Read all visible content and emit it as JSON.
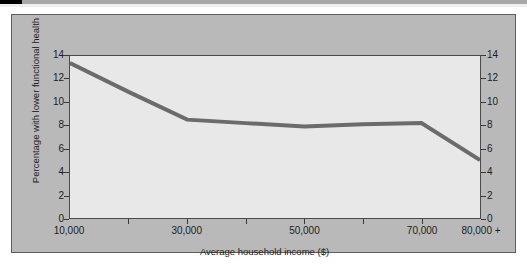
{
  "chart_data": {
    "type": "line",
    "title": "",
    "xlabel": "Average household income ($)",
    "ylabel": "Percentage with lower functional health",
    "x": [
      10000,
      20000,
      30000,
      40000,
      50000,
      60000,
      70000,
      80000
    ],
    "categories": [
      "10,000",
      "20,000",
      "30,000",
      "40,000",
      "50,000",
      "60,000",
      "70,000",
      "80,000 +"
    ],
    "values": [
      13.4,
      10.9,
      8.5,
      8.2,
      7.9,
      8.1,
      8.2,
      5.0
    ],
    "series": [
      {
        "name": "Percentage with lower functional health",
        "values": [
          13.4,
          10.9,
          8.5,
          8.2,
          7.9,
          8.1,
          8.2,
          5.0
        ],
        "color": "#6b6b6b"
      }
    ],
    "xlim": [
      10000,
      80000
    ],
    "ylim": [
      0,
      14
    ],
    "y_ticks": [
      0,
      2,
      4,
      6,
      8,
      10,
      12,
      14
    ],
    "y_tick_labels": [
      "0",
      "2",
      "4",
      "6",
      "8",
      "10",
      "12",
      "14"
    ],
    "y_axis_right_tick_labels": [
      "0",
      "2",
      "4",
      "6",
      "8",
      "10",
      "12",
      "14"
    ],
    "x_major_ticks": [
      10000,
      30000,
      50000,
      70000,
      80000
    ],
    "x_major_tick_labels": [
      "10,000",
      "30,000",
      "50,000",
      "70,000",
      "80,000 +"
    ],
    "x_minor_ticks": [
      20000,
      40000,
      60000
    ],
    "grid": false,
    "legend": "none",
    "dual_y_axis": true,
    "line_width_px": 4
  },
  "figure": {
    "panel_background": "#b9b9b9",
    "plot_background": "#e8e8e8",
    "frame_color": "#4a4a4a",
    "text_color": "#1d1d1d",
    "line_color": "#6b6b6b"
  }
}
